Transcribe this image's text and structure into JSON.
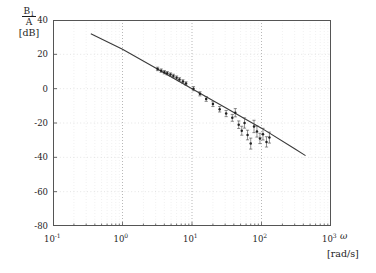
{
  "axes": {
    "ylabel_numerator": "B",
    "ylabel_numerator_sub": "1",
    "ylabel_denominator": "A",
    "ylabel_units": "[dB]",
    "xlabel_symbol": "ω",
    "xlabel_units": "[rad/s]",
    "ytick_labels": [
      "40",
      "20",
      "0",
      "-20",
      "-40",
      "-60",
      "-80"
    ],
    "xtick_mantissa": "10",
    "xtick_exponents": [
      "-1",
      "0",
      "1",
      "2",
      "3"
    ]
  },
  "chart_data": {
    "type": "scatter",
    "title": "",
    "xlabel": "ω [rad/s]",
    "ylabel": "B1/A [dB]",
    "xscale": "log",
    "yscale": "linear",
    "xlim": [
      0.1,
      1000
    ],
    "ylim": [
      -80,
      40
    ],
    "yticks": [
      40,
      20,
      0,
      -20,
      -40,
      -60,
      -80
    ],
    "xticks": [
      0.1,
      1,
      10,
      100,
      1000
    ],
    "grid": "minor-log-dotted",
    "legend": "none",
    "series": [
      {
        "name": "fitted model line",
        "type": "line",
        "x": [
          0.35,
          1.0,
          3.0,
          6.0,
          10.0,
          30.0,
          60.0,
          100.0,
          300.0,
          430.0
        ],
        "y": [
          32.0,
          23.0,
          12.0,
          5.0,
          0.0,
          -11.0,
          -18.0,
          -23.0,
          -35.0,
          -39.0
        ]
      },
      {
        "name": "measured data points",
        "type": "scatter-errorbar",
        "x": [
          3.2,
          3.6,
          4.0,
          4.4,
          4.9,
          5.4,
          6.0,
          6.6,
          7.4,
          8.2,
          10.5,
          13.0,
          16.0,
          20.0,
          25.0,
          31.0,
          38.0,
          42.0,
          47.0,
          52.0,
          57.0,
          63.0,
          70.0,
          78.0,
          86.0,
          95.0,
          105.0,
          118.0,
          130.0
        ],
        "y": [
          11.5,
          10.5,
          9.6,
          9.0,
          8.2,
          7.4,
          6.4,
          5.4,
          4.2,
          3.0,
          0.0,
          -3.0,
          -6.0,
          -9.0,
          -12.0,
          -14.5,
          -17.0,
          -14.0,
          -21.0,
          -24.5,
          -20.0,
          -27.0,
          -32.0,
          -22.0,
          -25.0,
          -29.0,
          -26.5,
          -31.0,
          -28.5
        ],
        "yerr": [
          1.0,
          1.0,
          1.0,
          1.0,
          1.0,
          1.0,
          1.0,
          1.0,
          1.0,
          1.0,
          1.2,
          1.2,
          1.4,
          1.4,
          1.6,
          1.8,
          2.0,
          2.4,
          2.2,
          2.6,
          3.0,
          2.8,
          3.2,
          3.6,
          3.2,
          3.0,
          3.4,
          3.0,
          3.2
        ]
      }
    ]
  }
}
